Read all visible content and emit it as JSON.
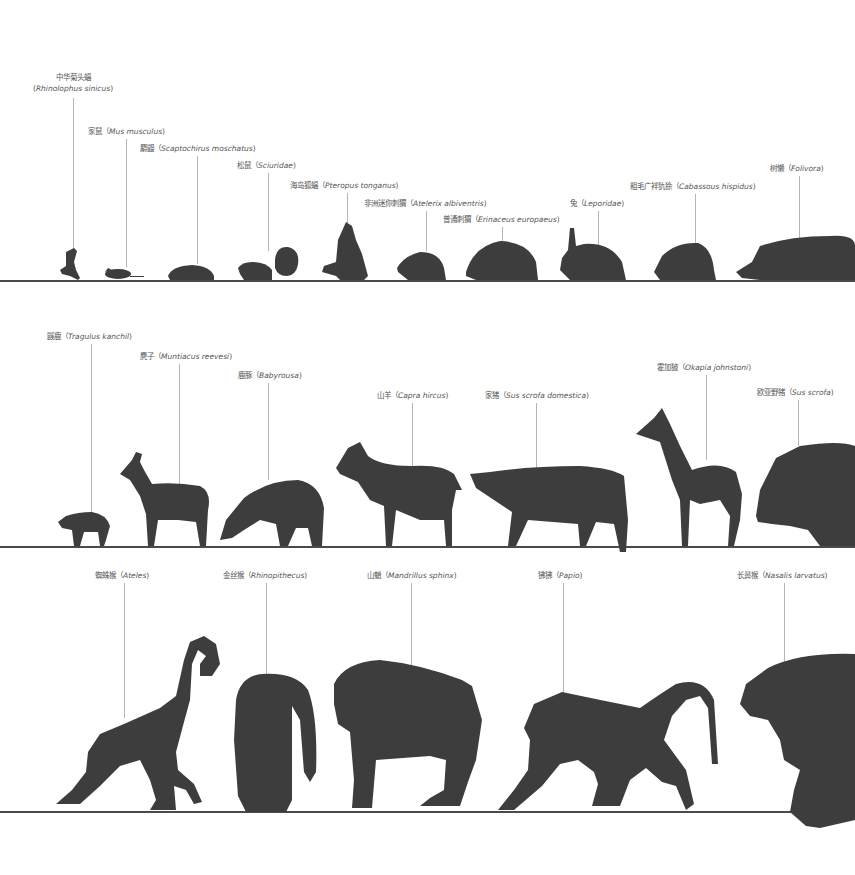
{
  "colors": {
    "silhouette": "#3d3d3d",
    "ground_line": "#4a4a4a",
    "leader_line": "#b5b5b5",
    "label_text": "#555555",
    "background": "#ffffff"
  },
  "rows": [
    {
      "id": "row-1",
      "ground_y": 281,
      "animals": [
        {
          "cn": "中华菊头蝠",
          "sci": "Rhinolophus sinicus",
          "label_stacked": true
        },
        {
          "cn": "家鼠",
          "sci": "Mus musculus"
        },
        {
          "cn": "麝鼹",
          "sci": "Scaptochirus moschatus"
        },
        {
          "cn": "松鼠",
          "sci": "Sciuridae"
        },
        {
          "cn": "海岛狐蝠",
          "sci": "Pteropus tonganus"
        },
        {
          "cn": "非洲迷你刺猬",
          "sci": "Atelerix albiventris"
        },
        {
          "cn": "普通刺猬",
          "sci": "Erinaceus europaeus"
        },
        {
          "cn": "兔",
          "sci": "Leporidae"
        },
        {
          "cn": "粗毛广袢犰狳",
          "sci": "Cabassous hispidus"
        },
        {
          "cn": "树懒",
          "sci": "Folivora"
        }
      ]
    },
    {
      "id": "row-2",
      "ground_y": 547,
      "animals": [
        {
          "cn": "鼷鹿",
          "sci": "Tragulus kanchil"
        },
        {
          "cn": "麂子",
          "sci": "Muntiacus reevesi"
        },
        {
          "cn": "鹿豚",
          "sci": "Babyrousa"
        },
        {
          "cn": "山羊",
          "sci": "Capra hircus"
        },
        {
          "cn": "家猪",
          "sci": "Sus scrofa domestica"
        },
        {
          "cn": "霍加狓",
          "sci": "Okapia johnstoni"
        },
        {
          "cn": "欧亚野猪",
          "sci": "Sus scrofa"
        }
      ]
    },
    {
      "id": "row-3",
      "ground_y": 812,
      "animals": [
        {
          "cn": "蜘蛛猴",
          "sci": "Ateles"
        },
        {
          "cn": "金丝猴",
          "sci": "Rhinopithecus"
        },
        {
          "cn": "山魈",
          "sci": "Mandrillus sphinx"
        },
        {
          "cn": "狒狒",
          "sci": "Papio"
        },
        {
          "cn": "长鼻猴",
          "sci": "Nasalis larvatus"
        }
      ]
    }
  ]
}
